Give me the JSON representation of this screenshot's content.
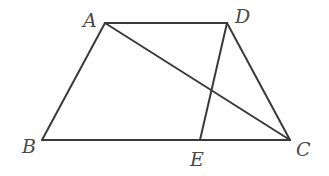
{
  "diagram": {
    "type": "geometry",
    "figure": "quadrilateral ABCD with diagonal AC and segment DE",
    "stroke_color": "#3a3a3a",
    "label_color": "#4a4a4a",
    "points": {
      "A": {
        "label": "A",
        "x": 105,
        "y": 23,
        "lx": 83,
        "ly": 27
      },
      "D": {
        "label": "D",
        "x": 227,
        "y": 23,
        "lx": 235,
        "ly": 23
      },
      "B": {
        "label": "B",
        "x": 42,
        "y": 140,
        "lx": 22,
        "ly": 153
      },
      "C": {
        "label": "C",
        "x": 290,
        "y": 140,
        "lx": 296,
        "ly": 156
      },
      "E": {
        "label": "E",
        "x": 200,
        "y": 140,
        "lx": 190,
        "ly": 166
      }
    },
    "segments": [
      {
        "name": "AD",
        "from": "A",
        "to": "D"
      },
      {
        "name": "AB",
        "from": "A",
        "to": "B"
      },
      {
        "name": "BC",
        "from": "B",
        "to": "C"
      },
      {
        "name": "DC",
        "from": "D",
        "to": "C"
      },
      {
        "name": "AC",
        "from": "A",
        "to": "C"
      },
      {
        "name": "DE",
        "from": "D",
        "to": "E"
      }
    ]
  }
}
